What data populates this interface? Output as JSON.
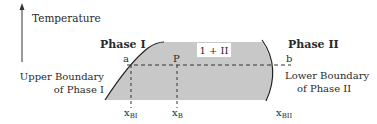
{
  "diagram": {
    "axis_label": "Temperature",
    "phase1_label": "Phase I",
    "phase2_label": "Phase II",
    "region_label": "1 + II",
    "point_a": "a",
    "point_p": "P",
    "point_b": "b",
    "upper_boundary_line1": "Upper Boundary",
    "upper_boundary_line2": "of Phase I",
    "lower_boundary_line1": "Lower Boundary",
    "lower_boundary_line2": "of Phase II",
    "x_bi": {
      "main": "x",
      "sub": "BI"
    },
    "x_b": {
      "main": "x",
      "sub": "B"
    },
    "x_bii": {
      "main": "x",
      "sub": "BII"
    },
    "colors": {
      "region_fill": "#c8c8c8",
      "line": "#222222",
      "text": "#2a2a2a"
    }
  }
}
